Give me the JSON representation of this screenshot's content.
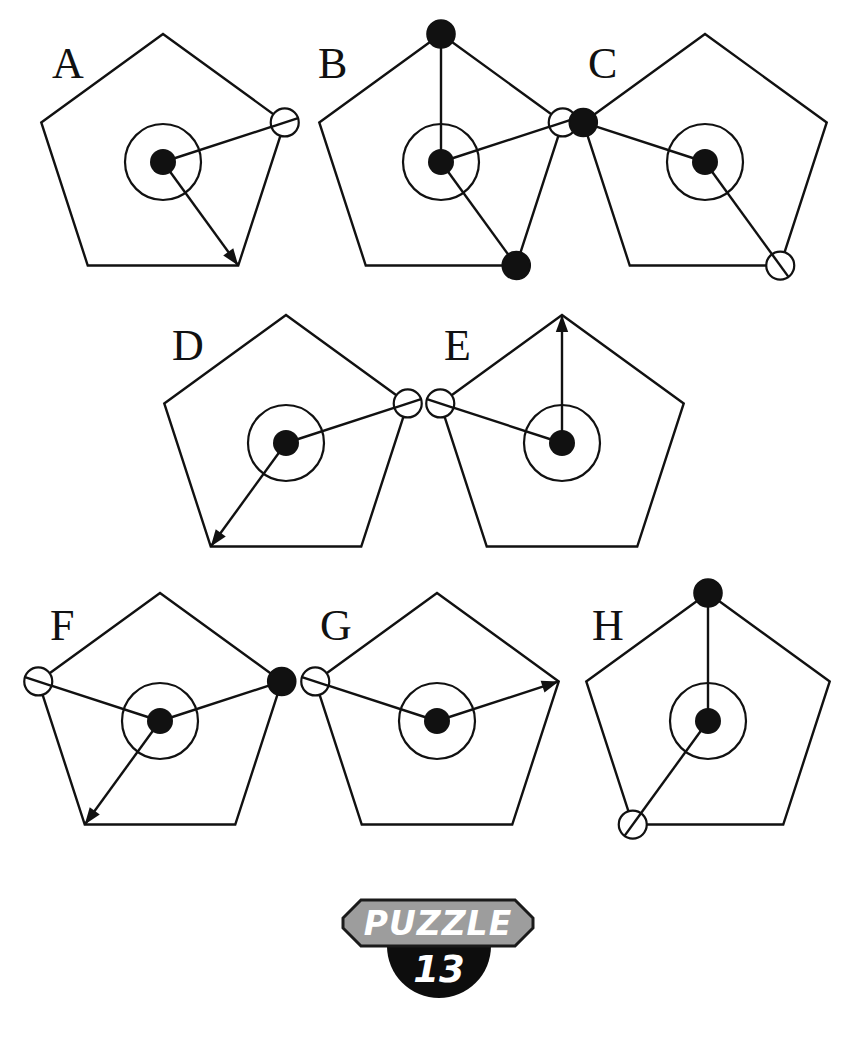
{
  "page": {
    "background_color": "#ffffff",
    "ink_color": "#111111",
    "width": 850,
    "height": 1043,
    "kind": "visual-reasoning-puzzle",
    "figure_shape": "pentagon"
  },
  "badge": {
    "word": "PUZZLE",
    "number": "13",
    "plate_color": "#9d9d9d",
    "tab_color": "#0d0d0d",
    "text_color": "#ffffff",
    "plate_x": 343,
    "plate_y": 900,
    "plate_w": 190,
    "plate_h": 46,
    "notch": 18,
    "tab_cx": 439,
    "tab_cy": 946,
    "tab_r": 52
  },
  "geometry": {
    "pentagon_radius": 128,
    "hub_radius": 13,
    "ring_radius": 38,
    "marker_radius": 14,
    "vertex_names": [
      "top",
      "upper-right",
      "lower-right",
      "lower-left",
      "upper-left"
    ],
    "vertex_angles_deg": [
      -90,
      -18,
      54,
      126,
      198
    ]
  },
  "panels": [
    {
      "id": "A",
      "label": "A",
      "label_x": 52,
      "label_y": 78,
      "cx": 163,
      "cy": 162,
      "spokes": [
        {
          "vertex": "upper-right",
          "marker": "open",
          "arrow": false
        },
        {
          "vertex": "lower-right",
          "marker": "none",
          "arrow": true
        }
      ]
    },
    {
      "id": "B",
      "label": "B",
      "label_x": 318,
      "label_y": 78,
      "cx": 441,
      "cy": 162,
      "spokes": [
        {
          "vertex": "top",
          "marker": "filled",
          "arrow": false
        },
        {
          "vertex": "upper-right",
          "marker": "open",
          "arrow": false
        },
        {
          "vertex": "lower-right",
          "marker": "filled",
          "arrow": false
        }
      ]
    },
    {
      "id": "C",
      "label": "C",
      "label_x": 588,
      "label_y": 78,
      "cx": 705,
      "cy": 162,
      "spokes": [
        {
          "vertex": "upper-left",
          "marker": "filled",
          "arrow": false
        },
        {
          "vertex": "lower-right",
          "marker": "open",
          "arrow": false
        }
      ]
    },
    {
      "id": "D",
      "label": "D",
      "label_x": 172,
      "label_y": 360,
      "cx": 286,
      "cy": 443,
      "spokes": [
        {
          "vertex": "upper-right",
          "marker": "open",
          "arrow": false
        },
        {
          "vertex": "lower-left",
          "marker": "none",
          "arrow": true
        }
      ]
    },
    {
      "id": "E",
      "label": "E",
      "label_x": 444,
      "label_y": 360,
      "cx": 562,
      "cy": 443,
      "spokes": [
        {
          "vertex": "top",
          "marker": "none",
          "arrow": true
        },
        {
          "vertex": "upper-left",
          "marker": "open",
          "arrow": false
        }
      ]
    },
    {
      "id": "F",
      "label": "F",
      "label_x": 50,
      "label_y": 640,
      "cx": 160,
      "cy": 721,
      "spokes": [
        {
          "vertex": "upper-left",
          "marker": "open",
          "arrow": false
        },
        {
          "vertex": "upper-right",
          "marker": "filled",
          "arrow": false
        },
        {
          "vertex": "lower-left",
          "marker": "none",
          "arrow": true
        }
      ]
    },
    {
      "id": "G",
      "label": "G",
      "label_x": 320,
      "label_y": 640,
      "cx": 437,
      "cy": 721,
      "spokes": [
        {
          "vertex": "upper-left",
          "marker": "open",
          "arrow": false
        },
        {
          "vertex": "upper-right",
          "marker": "none",
          "arrow": true
        }
      ]
    },
    {
      "id": "H",
      "label": "H",
      "label_x": 592,
      "label_y": 640,
      "cx": 708,
      "cy": 721,
      "spokes": [
        {
          "vertex": "top",
          "marker": "filled",
          "arrow": false
        },
        {
          "vertex": "lower-left",
          "marker": "open",
          "arrow": false
        }
      ]
    }
  ]
}
